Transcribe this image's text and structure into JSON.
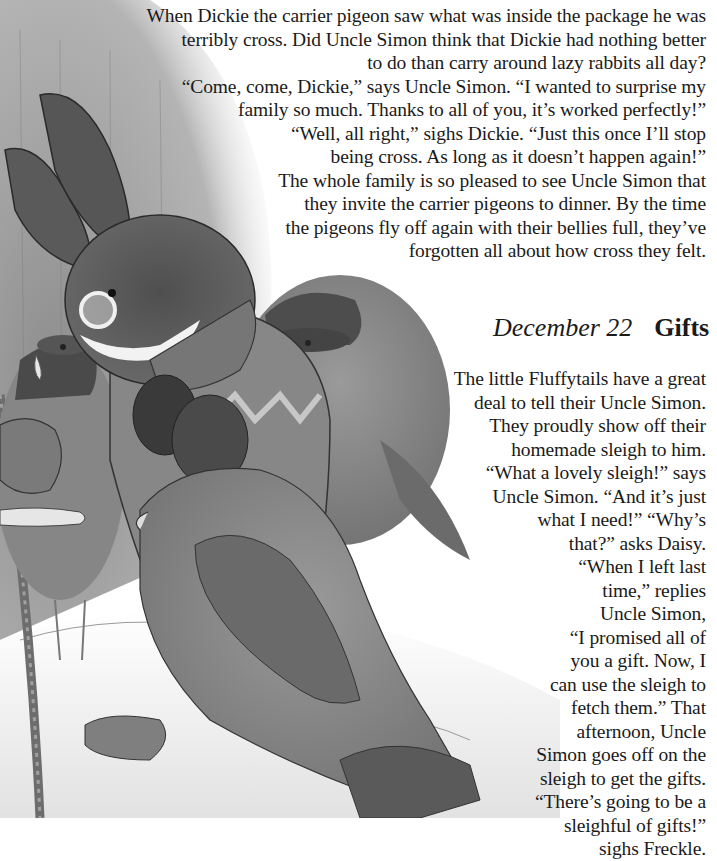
{
  "page": {
    "top_story": {
      "lines": [
        "When Dickie the carrier pigeon saw what was inside the package he was",
        "terribly cross. Did Uncle Simon think that Dickie had nothing better",
        "to do than carry around lazy rabbits all day?",
        "“Come, come, Dickie,” says Uncle Simon. “I wanted to surprise my",
        "family so much. Thanks to all of you, it’s worked perfectly!”",
        "“Well, all right,” sighs Dickie. “Just this once I’ll stop",
        "being cross. As long as it doesn’t happen again!”",
        "The whole family is so pleased to see Uncle Simon that",
        "they invite the carrier pigeons to dinner. By the time",
        "the pigeons fly off again with their bellies full, they’ve",
        "forgotten all about how cross they felt."
      ]
    },
    "heading": {
      "date": "December 22",
      "title": "Gifts"
    },
    "bottom_story": {
      "lines": [
        "The little Fluffytails have a great",
        "deal to tell their Uncle Simon.",
        "They proudly show off their",
        "homemade sleigh to him.",
        "“What a lovely sleigh!” says",
        "Uncle Simon. “And it’s just",
        "what I need!” “Why’s",
        "that?” asks Daisy.",
        "“When I left last",
        "time,” replies",
        "Uncle Simon,",
        "“I promised all of",
        "you a gift. Now, I",
        "can use the sleigh to",
        "fetch them.” That",
        "afternoon, Uncle",
        "Simon goes off on the",
        "sleigh to get the gifts.",
        "“There’s going to be a",
        "sleighful of gifts!”",
        "sighs Freckle."
      ]
    },
    "illustration": {
      "description": "Grayscale illustration of a rabbit (Uncle Simon) in glasses, sweater and mittens, with carrier pigeons wearing caps, in a snowy scene",
      "colors": {
        "background": "#ffffff",
        "snow": "#ececec",
        "dome": "#a9a9a9",
        "rabbit": "#5e5e5e",
        "rabbit_dark": "#3f3f3f",
        "sweater": "#8a8a8a",
        "pigeon": "#7d7d7d",
        "pigeon_dark": "#545454",
        "cap": "#474747",
        "line": "#2e2e2e"
      }
    }
  }
}
